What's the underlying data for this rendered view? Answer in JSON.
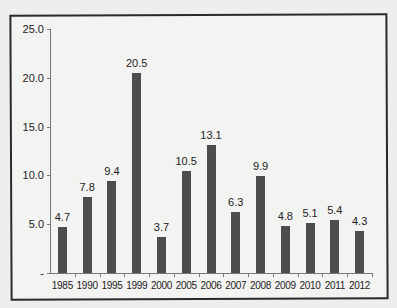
{
  "chart_data": {
    "type": "bar",
    "title": "",
    "xlabel": "",
    "ylabel": "",
    "categories": [
      "1985",
      "1990",
      "1995",
      "1999",
      "2000",
      "2005",
      "2006",
      "2007",
      "2008",
      "2009",
      "2010",
      "2011",
      "2012"
    ],
    "values": [
      4.7,
      7.8,
      9.4,
      20.5,
      3.7,
      10.5,
      13.1,
      6.3,
      9.9,
      4.8,
      5.1,
      5.4,
      4.3
    ],
    "value_labels": [
      "4.7",
      "7.8",
      "9.4",
      "20.5",
      "3.7",
      "10.5",
      "13.1",
      "6.3",
      "9.9",
      "4.8",
      "5.1",
      "5.4",
      "4.3"
    ],
    "ylim": [
      0,
      25
    ],
    "yticks": [
      "-",
      "5.0",
      "10.0",
      "15.0",
      "20.0",
      "25.0"
    ],
    "grid": false,
    "legend": null,
    "bar_color": "#4d4d4d"
  }
}
